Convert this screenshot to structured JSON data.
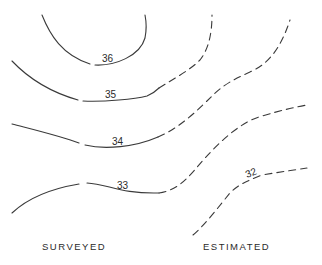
{
  "diagram": {
    "type": "contour-map",
    "contours": [
      {
        "value": "36",
        "style": "solid"
      },
      {
        "value": "35",
        "style": "solid-then-dashed"
      },
      {
        "value": "34",
        "style": "solid-then-dashed"
      },
      {
        "value": "33",
        "style": "solid-then-dashed"
      },
      {
        "value": "32",
        "style": "dashed"
      }
    ],
    "labels": {
      "surveyed": "SURVEYED",
      "estimated": "ESTIMATED"
    },
    "contour_labels": {
      "c36": "36",
      "c35": "35",
      "c34": "34",
      "c33": "33",
      "c32": "32"
    }
  }
}
